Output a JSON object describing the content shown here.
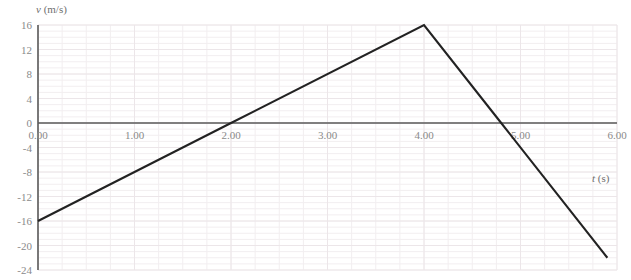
{
  "chart_data": {
    "type": "line",
    "title": "",
    "xlabel": "t (s)",
    "ylabel": "v (m/s)",
    "xlabel_var": "t",
    "xlabel_unit": " (s)",
    "ylabel_var": "v",
    "ylabel_unit": " (m/s)",
    "xlim": [
      0,
      6
    ],
    "ylim": [
      -24,
      16
    ],
    "grid": true,
    "grid_minor": true,
    "legend": "none",
    "x_ticks": [
      0,
      1,
      2,
      3,
      4,
      5,
      6
    ],
    "x_tick_labels": [
      "0.00",
      "1.00",
      "2.00",
      "3.00",
      "4.00",
      "5.00",
      "6.00"
    ],
    "y_ticks": [
      16,
      12,
      8,
      4,
      0,
      -4,
      -8,
      -12,
      -16,
      -20,
      -24
    ],
    "y_tick_labels": [
      "16",
      "12",
      "8",
      "4",
      "0",
      "-4",
      "-8",
      "-12",
      "-16",
      "-20",
      "-24"
    ],
    "series": [
      {
        "name": "velocity",
        "color": "#222222",
        "points": [
          {
            "x": 0.0,
            "y": -16.0
          },
          {
            "x": 2.0,
            "y": 0.0
          },
          {
            "x": 4.0,
            "y": 16.0
          },
          {
            "x": 4.8,
            "y": 0.0
          },
          {
            "x": 5.9,
            "y": -22.0
          }
        ]
      }
    ],
    "annotations": {
      "zero_crossing_1": "2.00",
      "zero_crossing_2": "4.80",
      "peak_t": "4.00",
      "peak_v": "16",
      "start_v": "-16"
    },
    "colors": {
      "axis": "#5a5a5a",
      "grid_major": "#ece6e9",
      "grid_minor": "#f2eef0",
      "tick_text": "#8a8a8a",
      "axis_title": "#6f6f6f",
      "line": "#222222",
      "background": "#ffffff"
    }
  }
}
